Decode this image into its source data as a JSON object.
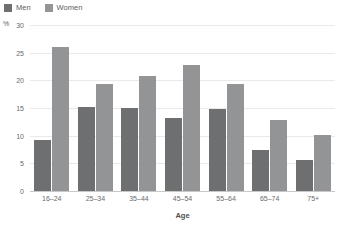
{
  "chart_data": {
    "type": "bar",
    "title": "",
    "subtitle": "",
    "xlabel": "Age",
    "ylabel": "%",
    "ylim": [
      0,
      30
    ],
    "yticks": [
      30,
      25,
      20,
      15,
      10,
      5,
      0
    ],
    "grid": true,
    "legend_position": "top-left",
    "categories": [
      "16–24",
      "25–34",
      "35–44",
      "45–54",
      "55–64",
      "65–74",
      "75+"
    ],
    "series": [
      {
        "name": "Men",
        "color": "#6e6f71",
        "values": [
          9.2,
          15.2,
          15.0,
          13.2,
          14.8,
          7.5,
          5.6
        ]
      },
      {
        "name": "Women",
        "color": "#939496",
        "values": [
          26.1,
          19.3,
          20.8,
          22.8,
          19.4,
          12.8,
          10.2
        ]
      }
    ]
  },
  "legend": {
    "items": [
      {
        "label": "Men",
        "color": "#6e6f71"
      },
      {
        "label": "Women",
        "color": "#939496"
      }
    ]
  },
  "axes": {
    "y_unit": "%",
    "y_tick_labels": [
      "30",
      "25",
      "20",
      "15",
      "10",
      "5",
      "0"
    ],
    "x_title": "Age",
    "x_tick_labels": [
      "16–24",
      "25–34",
      "35–44",
      "45–54",
      "55–64",
      "65–74",
      "75+"
    ]
  }
}
